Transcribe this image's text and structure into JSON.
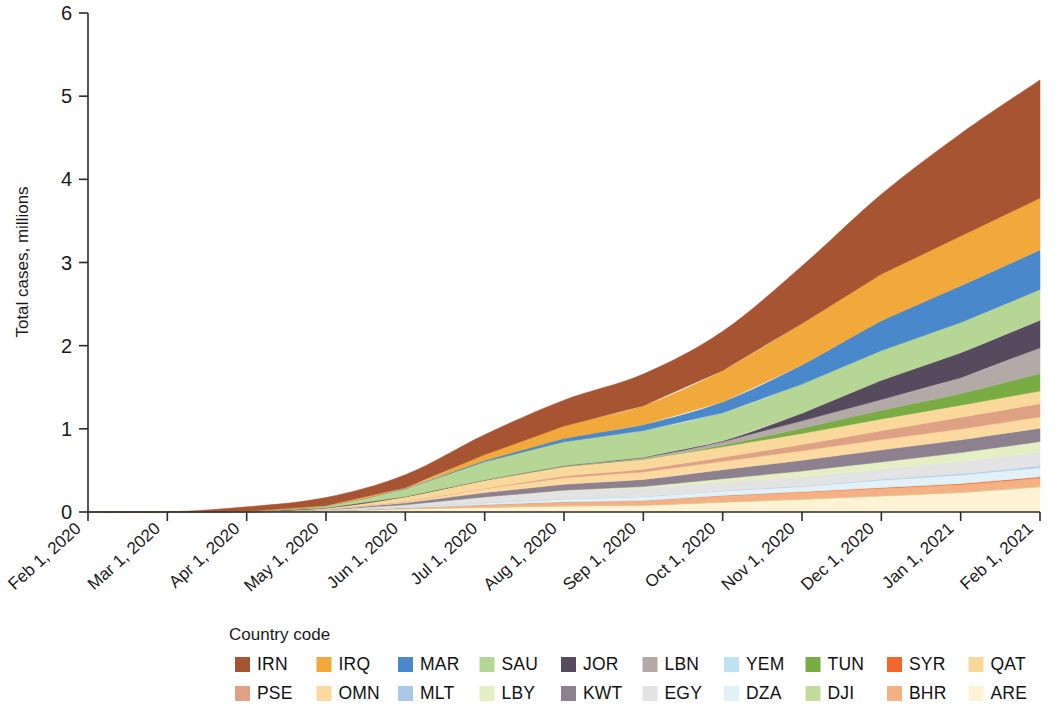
{
  "figure": {
    "background": "#ffffff"
  },
  "axes": {
    "y_title": "Total cases, millions",
    "y_ticks": [
      "0",
      "1",
      "2",
      "3",
      "4",
      "5",
      "6"
    ],
    "x_ticks": [
      "Feb 1, 2020",
      "Mar 1, 2020",
      "Apr 1, 2020",
      "May 1, 2020",
      "Jun 1, 2020",
      "Jul 1, 2020",
      "Aug 1, 2020",
      "Sep 1, 2020",
      "Oct 1, 2020",
      "Nov 1, 2020",
      "Dec 1, 2020",
      "Jan 1, 2021",
      "Feb 1, 2021"
    ]
  },
  "legend": {
    "title": "Country code",
    "rows": [
      [
        {
          "code": "IRN",
          "color": "#a65432"
        },
        {
          "code": "IRQ",
          "color": "#f2a93b"
        },
        {
          "code": "MAR",
          "color": "#4a88cc"
        },
        {
          "code": "SAU",
          "color": "#b5d694"
        },
        {
          "code": "JOR",
          "color": "#574a5e"
        },
        {
          "code": "LBN",
          "color": "#b3a9a6"
        },
        {
          "code": "YEM",
          "color": "#bfe2f2"
        },
        {
          "code": "TUN",
          "color": "#79ad43"
        },
        {
          "code": "SYR",
          "color": "#f2662a"
        },
        {
          "code": "QAT",
          "color": "#fad79b"
        }
      ],
      [
        {
          "code": "PSE",
          "color": "#dfa184"
        },
        {
          "code": "OMN",
          "color": "#fcd9a0"
        },
        {
          "code": "MLT",
          "color": "#abc8ea"
        },
        {
          "code": "LBY",
          "color": "#e4efc3"
        },
        {
          "code": "KWT",
          "color": "#8d8190"
        },
        {
          "code": "EGY",
          "color": "#e3e3e3"
        },
        {
          "code": "DZA",
          "color": "#e2f1f7"
        },
        {
          "code": "DJI",
          "color": "#c3dc9a"
        },
        {
          "code": "BHR",
          "color": "#f5b183"
        },
        {
          "code": "ARE",
          "color": "#fdf3d4"
        }
      ]
    ]
  },
  "chart_data": {
    "type": "area",
    "stacked": true,
    "title": "",
    "xlabel": "",
    "ylabel": "Total cases, millions",
    "ylim": [
      0,
      6
    ],
    "grid": false,
    "legend_position": "bottom",
    "legend_title": "Country code",
    "x": [
      "Feb 1, 2020",
      "Mar 1, 2020",
      "Apr 1, 2020",
      "May 1, 2020",
      "Jun 1, 2020",
      "Jul 1, 2020",
      "Aug 1, 2020",
      "Sep 1, 2020",
      "Oct 1, 2020",
      "Nov 1, 2020",
      "Dec 1, 2020",
      "Jan 1, 2021",
      "Feb 1, 2021"
    ],
    "units": "millions of total cases",
    "stack_order_top_to_bottom": [
      "IRN",
      "IRQ",
      "MAR",
      "SAU",
      "JOR",
      "LBN",
      "TUN",
      "QAT",
      "PSE",
      "OMN",
      "KWT",
      "LBY",
      "EGY",
      "MLT",
      "DZA",
      "YEM",
      "SYR",
      "BHR",
      "DJI",
      "ARE"
    ],
    "series": [
      {
        "name": "ARE",
        "color": "#fdf3d4",
        "values": [
          0,
          0.0,
          0.001,
          0.013,
          0.035,
          0.053,
          0.069,
          0.077,
          0.115,
          0.15,
          0.19,
          0.23,
          0.3
        ]
      },
      {
        "name": "DJI",
        "color": "#c3dc9a",
        "values": [
          0,
          0.0,
          0.0,
          0.001,
          0.004,
          0.005,
          0.005,
          0.005,
          0.006,
          0.006,
          0.006,
          0.006,
          0.007
        ]
      },
      {
        "name": "BHR",
        "color": "#f5b183",
        "values": [
          0,
          0.0,
          0.001,
          0.003,
          0.012,
          0.03,
          0.046,
          0.053,
          0.075,
          0.083,
          0.09,
          0.095,
          0.104
        ]
      },
      {
        "name": "SYR",
        "color": "#f2662a",
        "values": [
          0,
          0.0,
          0.0,
          0.0,
          0.0,
          0.001,
          0.002,
          0.003,
          0.004,
          0.006,
          0.009,
          0.012,
          0.014
        ]
      },
      {
        "name": "YEM",
        "color": "#bfe2f2",
        "values": [
          0,
          0.0,
          0.0,
          0.0,
          0.001,
          0.002,
          0.002,
          0.002,
          0.002,
          0.002,
          0.002,
          0.002,
          0.002
        ]
      },
      {
        "name": "DZA",
        "color": "#e2f1f7",
        "values": [
          0,
          0.0,
          0.001,
          0.004,
          0.009,
          0.019,
          0.033,
          0.045,
          0.052,
          0.06,
          0.087,
          0.1,
          0.108
        ]
      },
      {
        "name": "MLT",
        "color": "#abc8ea",
        "values": [
          0,
          0.0,
          0.0,
          0.0,
          0.001,
          0.001,
          0.002,
          0.002,
          0.003,
          0.006,
          0.01,
          0.014,
          0.019
        ]
      },
      {
        "name": "EGY",
        "color": "#e3e3e3",
        "values": [
          0,
          0.0,
          0.001,
          0.006,
          0.024,
          0.069,
          0.095,
          0.099,
          0.104,
          0.11,
          0.122,
          0.15,
          0.168
        ]
      },
      {
        "name": "LBY",
        "color": "#e4efc3",
        "values": [
          0,
          0.0,
          0.0,
          0.0,
          0.0,
          0.001,
          0.009,
          0.02,
          0.04,
          0.07,
          0.086,
          0.105,
          0.125
        ]
      },
      {
        "name": "KWT",
        "color": "#8d8190",
        "values": [
          0,
          0.0,
          0.0,
          0.004,
          0.024,
          0.052,
          0.07,
          0.086,
          0.108,
          0.129,
          0.145,
          0.154,
          0.161
        ]
      },
      {
        "name": "OMN",
        "color": "#fcd9a0",
        "values": [
          0,
          0.0,
          0.0,
          0.002,
          0.013,
          0.046,
          0.08,
          0.088,
          0.1,
          0.115,
          0.126,
          0.131,
          0.135
        ]
      },
      {
        "name": "PSE",
        "color": "#dfa184",
        "values": [
          0,
          0.0,
          0.0,
          0.0,
          0.002,
          0.005,
          0.02,
          0.035,
          0.049,
          0.075,
          0.105,
          0.14,
          0.16
        ]
      },
      {
        "name": "QAT",
        "color": "#fad79b",
        "values": [
          0,
          0.0,
          0.001,
          0.015,
          0.058,
          0.097,
          0.113,
          0.12,
          0.126,
          0.133,
          0.14,
          0.146,
          0.152
        ]
      },
      {
        "name": "TUN",
        "color": "#79ad43",
        "values": [
          0,
          0.0,
          0.0,
          0.001,
          0.001,
          0.001,
          0.002,
          0.004,
          0.02,
          0.063,
          0.105,
          0.14,
          0.21
        ]
      },
      {
        "name": "LBN",
        "color": "#b3a9a6",
        "values": [
          0,
          0.0,
          0.0,
          0.001,
          0.001,
          0.002,
          0.006,
          0.018,
          0.04,
          0.09,
          0.13,
          0.19,
          0.31
        ]
      },
      {
        "name": "JOR",
        "color": "#574a5e",
        "values": [
          0,
          0.0,
          0.0,
          0.0,
          0.001,
          0.001,
          0.001,
          0.002,
          0.01,
          0.09,
          0.23,
          0.3,
          0.33
        ]
      },
      {
        "name": "SAU",
        "color": "#b5d694",
        "values": [
          0,
          0.0,
          0.002,
          0.022,
          0.09,
          0.22,
          0.29,
          0.32,
          0.338,
          0.35,
          0.358,
          0.364,
          0.37
        ]
      },
      {
        "name": "MAR",
        "color": "#4a88cc",
        "values": [
          0,
          0.0,
          0.001,
          0.005,
          0.008,
          0.015,
          0.04,
          0.07,
          0.13,
          0.23,
          0.36,
          0.44,
          0.475
        ]
      },
      {
        "name": "IRQ",
        "color": "#f2a93b",
        "values": [
          0,
          0.0,
          0.001,
          0.002,
          0.009,
          0.07,
          0.15,
          0.23,
          0.38,
          0.5,
          0.56,
          0.6,
          0.625
        ]
      },
      {
        "name": "IRN",
        "color": "#a65432",
        "values": [
          0,
          0.001,
          0.053,
          0.095,
          0.155,
          0.24,
          0.31,
          0.38,
          0.47,
          0.69,
          0.96,
          1.23,
          1.42
        ]
      }
    ],
    "total_top_values": [
      0,
      0.001,
      0.062,
      0.174,
      0.448,
      0.929,
      1.345,
      1.659,
      2.177,
      2.957,
      3.777,
      4.549,
      5.195
    ]
  }
}
